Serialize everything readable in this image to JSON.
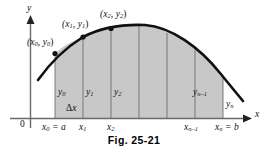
{
  "figure": {
    "caption": "Fig. 25-21",
    "axes": {
      "y_axis_label": "y",
      "x_axis_label": "x",
      "origin_label": "0"
    },
    "colors": {
      "region_fill": "#c8c8c8",
      "curve": "#111111",
      "axis": "#555555",
      "partition_line": "#6e6e6e",
      "background": "#ffffff",
      "text": "#111111"
    },
    "point_labels": [
      {
        "name": "point-label-0",
        "base": "(x",
        "sub1": "0",
        "mid": ", y",
        "sub2": "0",
        "close": ")",
        "x": 27,
        "y": 38
      },
      {
        "name": "point-label-1",
        "base": "(x",
        "sub1": "1",
        "mid": ", y",
        "sub2": "1",
        "close": ")",
        "x": 62,
        "y": 20
      },
      {
        "name": "point-label-2",
        "base": "(x",
        "sub1": "2",
        "mid": ", y",
        "sub2": "2",
        "close": ")",
        "x": 100,
        "y": 10
      }
    ],
    "ordinate_labels": [
      {
        "name": "ordinate-y0",
        "base": "y",
        "sub": "0",
        "x": 58,
        "y": 88
      },
      {
        "name": "ordinate-y1",
        "base": "y",
        "sub": "1",
        "x": 86,
        "y": 88
      },
      {
        "name": "ordinate-y2",
        "base": "y",
        "sub": "2",
        "x": 114,
        "y": 88
      },
      {
        "name": "ordinate-yn-1",
        "base": "y",
        "sub": "n–1",
        "x": 193,
        "y": 88
      },
      {
        "name": "ordinate-yn",
        "base": "y",
        "sub": "n",
        "x": 226,
        "y": 100
      }
    ],
    "delta_label": {
      "name": "delta-x-label",
      "symbol": "Δ",
      "base": "x",
      "x": 66,
      "y": 104
    },
    "tick_labels": [
      {
        "name": "tick-x0-equals-a",
        "base": "x",
        "sub": "0",
        "suffix": " = a",
        "x": 42,
        "y": 123
      },
      {
        "name": "tick-x1",
        "base": "x",
        "sub": "1",
        "suffix": "",
        "x": 79,
        "y": 123
      },
      {
        "name": "tick-x2",
        "base": "x",
        "sub": "2",
        "suffix": "",
        "x": 107,
        "y": 123
      },
      {
        "name": "tick-xn-1",
        "base": "x",
        "sub": "n–1",
        "suffix": "",
        "x": 184,
        "y": 123
      },
      {
        "name": "tick-xn-equals-b",
        "base": "x",
        "sub": "n",
        "suffix": " = b",
        "x": 215,
        "y": 123
      }
    ],
    "geometry": {
      "x_axis_y": 118,
      "y_axis_x": 30,
      "region_left": 55,
      "region_right": 223,
      "partition_x": [
        55,
        83,
        111,
        139,
        167,
        195,
        223
      ],
      "curve_path": "M 38,80 C 48,66 62,50 83,37 C 100,28 120,24 145,25 C 172,27 200,48 220,73 C 229,84 237,94 243,101",
      "region_path": "M 55,118 L 55,53.5 C 62,47 70,42 83,37 C 100,28 120,24 145,25 C 172,27 200,48 218,71 L 223,77.5 L 223,118 Z",
      "dots": [
        {
          "name": "curve-point-0",
          "cx": 55,
          "cy": 53.5
        },
        {
          "name": "curve-point-1",
          "cx": 83,
          "cy": 37
        },
        {
          "name": "curve-point-2",
          "cx": 111,
          "cy": 28.5
        }
      ]
    }
  }
}
